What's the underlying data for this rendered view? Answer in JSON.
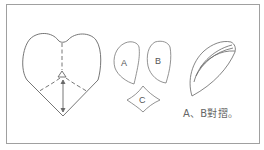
{
  "figure": {
    "frame_color": "#9a9a9a",
    "line_color": "#666666",
    "pieces": [
      {
        "id": "A",
        "label": "A"
      },
      {
        "id": "B",
        "label": "B"
      },
      {
        "id": "C",
        "label": "C"
      }
    ],
    "caption": "A、B對摺。"
  }
}
